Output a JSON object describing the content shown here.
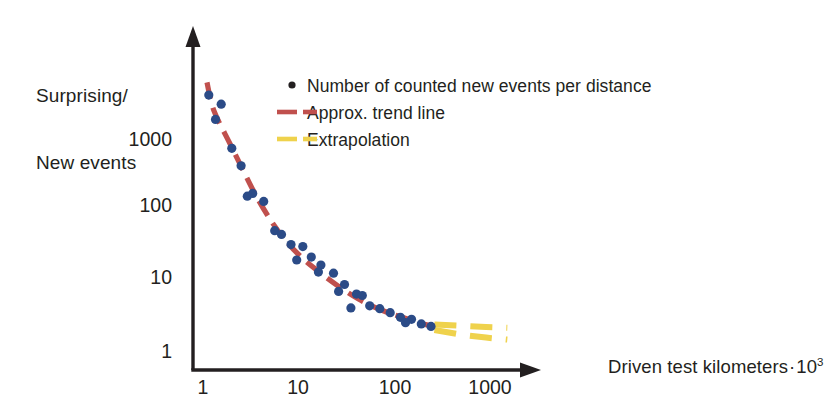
{
  "chart_data": {
    "type": "scatter",
    "title": "",
    "xlabel": "Driven test kilometers · 10³",
    "ylabel": "Surprising/\nNew events",
    "ylabel_line1": "Surprising/",
    "ylabel_line2": "New events",
    "xlabel_text": "Driven test kilometers",
    "xlabel_middot": "·",
    "xlabel_base": "10",
    "xlabel_exponent": "3",
    "xscale": "log",
    "yscale": "log",
    "xlim": [
      1,
      2000
    ],
    "ylim": [
      1,
      8000
    ],
    "grid": false,
    "xticks": [
      "1",
      "10",
      "100",
      "1000"
    ],
    "xtick_values": [
      1,
      10,
      100,
      1000
    ],
    "yticks": [
      "1",
      "10",
      "100",
      "1000"
    ],
    "ytick_values": [
      1,
      10,
      100,
      1000
    ],
    "legend_position": "upper-right-inside",
    "series": [
      {
        "name": "Number of counted new events per distance",
        "type": "scatter",
        "marker": "circle",
        "color": "#2b4b87",
        "points": [
          [
            1.15,
            4300
          ],
          [
            1.55,
            3200
          ],
          [
            1.35,
            1950
          ],
          [
            2.0,
            760
          ],
          [
            2.5,
            430
          ],
          [
            3.3,
            175
          ],
          [
            2.9,
            160
          ],
          [
            4.3,
            135
          ],
          [
            5.6,
            52
          ],
          [
            6.6,
            46
          ],
          [
            8.3,
            33
          ],
          [
            11.0,
            31
          ],
          [
            13.5,
            22
          ],
          [
            9.5,
            20
          ],
          [
            17.0,
            17
          ],
          [
            16.0,
            13.5
          ],
          [
            23.0,
            13.0
          ],
          [
            30.0,
            9.0
          ],
          [
            26.0,
            7.2
          ],
          [
            40.0,
            6.6
          ],
          [
            46.0,
            6.3
          ],
          [
            55.0,
            4.5
          ],
          [
            35.0,
            4.2
          ],
          [
            70.0,
            4.1
          ],
          [
            90.0,
            3.6
          ],
          [
            115.0,
            3.1
          ],
          [
            150.0,
            2.9
          ],
          [
            130.0,
            2.6
          ],
          [
            190.0,
            2.5
          ],
          [
            240.0,
            2.3
          ]
        ]
      },
      {
        "name": "Approx. trend line",
        "type": "line",
        "style": "dashed",
        "color": "#c0504d",
        "points": [
          [
            1.1,
            6500
          ],
          [
            1.3,
            2600
          ],
          [
            1.9,
            900
          ],
          [
            2.6,
            380
          ],
          [
            3.6,
            160
          ],
          [
            5.2,
            70
          ],
          [
            7.5,
            36
          ],
          [
            11.0,
            21
          ],
          [
            17.0,
            13
          ],
          [
            26.0,
            8.5
          ],
          [
            42.0,
            5.6
          ],
          [
            70.0,
            4.0
          ],
          [
            120.0,
            3.1
          ],
          [
            200.0,
            2.5
          ],
          [
            260.0,
            2.3
          ]
        ]
      },
      {
        "name": "Extrapolation",
        "type": "band",
        "style": "dashed",
        "color": "#efd24c",
        "upper": [
          [
            260,
            2.45
          ],
          [
            500,
            2.35
          ],
          [
            900,
            2.25
          ],
          [
            1500,
            2.2
          ]
        ],
        "lower": [
          [
            260,
            2.05
          ],
          [
            500,
            1.75
          ],
          [
            900,
            1.6
          ],
          [
            1500,
            1.5
          ]
        ]
      }
    ]
  },
  "legend": {
    "items": [
      {
        "label": "Number of counted new events per distance",
        "marker": "dot",
        "color": "#231f20"
      },
      {
        "label": "Approx. trend line",
        "marker": "dashed-line",
        "color": "#c0504d"
      },
      {
        "label": "Extrapolation",
        "marker": "dashed-line",
        "color": "#efd24c"
      }
    ]
  },
  "colors": {
    "scatter": "#2b4b87",
    "trend": "#c0504d",
    "extrapolation": "#efd24c",
    "axis": "#231f20",
    "text": "#231f20",
    "background": "#ffffff"
  }
}
